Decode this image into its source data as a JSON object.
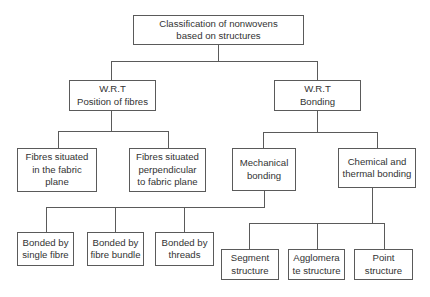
{
  "diagram": {
    "title": "Classification of nonwovens based on structures",
    "root": {
      "lines": [
        "Classification of nonwovens",
        "based on structures"
      ]
    },
    "level1": [
      {
        "id": "wrt-position",
        "lines": [
          "W.R.T",
          "Position of fibres"
        ]
      },
      {
        "id": "wrt-bonding",
        "lines": [
          "W.R.T",
          "Bonding"
        ]
      }
    ],
    "position_children": [
      {
        "id": "in-plane",
        "lines": [
          "Fibres situated",
          "in the fabric",
          "plane"
        ]
      },
      {
        "id": "perpendicular",
        "lines": [
          "Fibres situated",
          "perpendicular",
          "to fabric plane"
        ]
      }
    ],
    "bonding_children": [
      {
        "id": "mechanical",
        "lines": [
          "Mechanical",
          "bonding"
        ]
      },
      {
        "id": "chemical-thermal",
        "lines": [
          "Chemical and",
          "thermal bonding"
        ]
      }
    ],
    "mechanical_children": [
      {
        "id": "single-fibre",
        "lines": [
          "Bonded by",
          "single fibre"
        ]
      },
      {
        "id": "fibre-bundle",
        "lines": [
          "Bonded by",
          "fibre bundle"
        ]
      },
      {
        "id": "threads",
        "lines": [
          "Bonded by",
          "threads"
        ]
      }
    ],
    "chemical_children": [
      {
        "id": "segment",
        "lines": [
          "Segment",
          "structure"
        ]
      },
      {
        "id": "agglomerate",
        "lines": [
          "Agglomera",
          "te structure"
        ]
      },
      {
        "id": "point",
        "lines": [
          "Point",
          "structure"
        ]
      }
    ],
    "colors": {
      "border": "#5a5a5a",
      "text": "#333333",
      "background": "#ffffff"
    }
  }
}
